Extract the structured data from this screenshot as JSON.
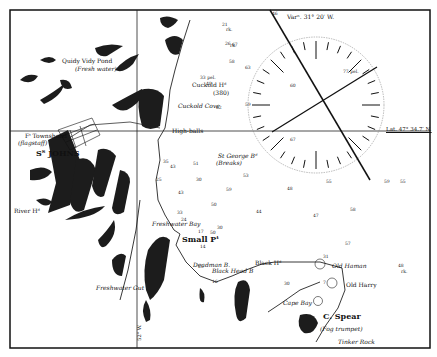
{
  "map": {
    "title": "Chart of St. John's Harbour and approaches",
    "variation_label": "Varⁿ. 31° 20′ W.",
    "latitude_label": "Lat. 47° 34.7′ N.",
    "meridian_label": "52° W.",
    "compass": {
      "center_x": 316,
      "center_y": 105,
      "radius": 68
    },
    "places": [
      {
        "name": "Quidy Vidy Pond",
        "x": 62,
        "y": 58,
        "size": "mid",
        "italic": false
      },
      {
        "name": "(Fresh water)",
        "x": 75,
        "y": 66,
        "size": "mid",
        "italic": true
      },
      {
        "name": "Cuckold Hᵈ",
        "x": 192,
        "y": 82,
        "size": "mid",
        "italic": false
      },
      {
        "name": "(380)",
        "x": 213,
        "y": 90,
        "size": "mid",
        "italic": false
      },
      {
        "name": "Cuckold Cove",
        "x": 178,
        "y": 103,
        "size": "mid",
        "italic": true
      },
      {
        "name": "High-balls",
        "x": 172,
        "y": 128,
        "size": "mid",
        "italic": false
      },
      {
        "name": "Fᵗ Townshend",
        "x": 25,
        "y": 133,
        "size": "mid",
        "italic": false
      },
      {
        "name": "(flagstaff)",
        "x": 18,
        "y": 140,
        "size": "mid",
        "italic": true
      },
      {
        "name": "Sᵀ JOHNS",
        "x": 36,
        "y": 149,
        "size": "big",
        "italic": false
      },
      {
        "name": "St George Bᵈ",
        "x": 218,
        "y": 153,
        "size": "mid",
        "italic": true
      },
      {
        "name": "(Breaks)",
        "x": 216,
        "y": 160,
        "size": "mid",
        "italic": true
      },
      {
        "name": "River Hᵈ",
        "x": 14,
        "y": 208,
        "size": "mid",
        "italic": false
      },
      {
        "name": "Freshwater Bay",
        "x": 152,
        "y": 221,
        "size": "mid",
        "italic": true
      },
      {
        "name": "Small Pᵗ",
        "x": 182,
        "y": 235,
        "size": "big",
        "italic": false
      },
      {
        "name": "Deadman B.",
        "x": 193,
        "y": 262,
        "size": "mid",
        "italic": true
      },
      {
        "name": "Black Head B",
        "x": 212,
        "y": 268,
        "size": "mid",
        "italic": true
      },
      {
        "name": "Black Hᵈ",
        "x": 255,
        "y": 260,
        "size": "mid",
        "italic": false
      },
      {
        "name": "Freshwater Gut",
        "x": 96,
        "y": 285,
        "size": "mid",
        "italic": true
      },
      {
        "name": "Old Haman",
        "x": 332,
        "y": 263,
        "size": "mid",
        "italic": true
      },
      {
        "name": "Old Harry",
        "x": 346,
        "y": 282,
        "size": "mid",
        "italic": false
      },
      {
        "name": "Cape Bay",
        "x": 283,
        "y": 300,
        "size": "mid",
        "italic": true
      },
      {
        "name": "C. Spear",
        "x": 323,
        "y": 312,
        "size": "big",
        "italic": false
      },
      {
        "name": "(Fog trumpet)",
        "x": 320,
        "y": 326,
        "size": "mid",
        "italic": true
      },
      {
        "name": "Tinker Rock",
        "x": 338,
        "y": 339,
        "size": "mid",
        "italic": true
      }
    ],
    "soundings": [
      {
        "v": "21",
        "x": 222,
        "y": 23
      },
      {
        "v": "rk.",
        "x": 226,
        "y": 28
      },
      {
        "v": "26",
        "x": 225,
        "y": 42
      },
      {
        "v": "rk.",
        "x": 230,
        "y": 44
      },
      {
        "v": "67",
        "x": 232,
        "y": 43
      },
      {
        "v": "63",
        "x": 245,
        "y": 66
      },
      {
        "v": "58",
        "x": 229,
        "y": 60
      },
      {
        "v": "62",
        "x": 216,
        "y": 106
      },
      {
        "v": "59",
        "x": 245,
        "y": 103
      },
      {
        "v": "49",
        "x": 206,
        "y": 82
      },
      {
        "v": "33 pel.",
        "x": 200,
        "y": 76
      },
      {
        "v": "60",
        "x": 290,
        "y": 84
      },
      {
        "v": "77 pel.",
        "x": 343,
        "y": 70
      },
      {
        "v": "67",
        "x": 290,
        "y": 138
      },
      {
        "v": "46",
        "x": 272,
        "y": 12
      },
      {
        "v": "48",
        "x": 287,
        "y": 187
      },
      {
        "v": "55",
        "x": 326,
        "y": 180
      },
      {
        "v": "59",
        "x": 226,
        "y": 188
      },
      {
        "v": "53",
        "x": 243,
        "y": 174
      },
      {
        "v": "59",
        "x": 384,
        "y": 180
      },
      {
        "v": "55",
        "x": 400,
        "y": 180
      },
      {
        "v": "50",
        "x": 211,
        "y": 203
      },
      {
        "v": "50",
        "x": 210,
        "y": 231
      },
      {
        "v": "44",
        "x": 256,
        "y": 210
      },
      {
        "v": "47",
        "x": 313,
        "y": 214
      },
      {
        "v": "58",
        "x": 350,
        "y": 208
      },
      {
        "v": "57",
        "x": 345,
        "y": 242
      },
      {
        "v": "48",
        "x": 398,
        "y": 264
      },
      {
        "v": "rk.",
        "x": 401,
        "y": 270
      },
      {
        "v": "31",
        "x": 323,
        "y": 255
      },
      {
        "v": "30",
        "x": 284,
        "y": 282
      },
      {
        "v": "7",
        "x": 323,
        "y": 281
      },
      {
        "v": "24",
        "x": 181,
        "y": 218
      },
      {
        "v": "17",
        "x": 198,
        "y": 230
      },
      {
        "v": "30",
        "x": 217,
        "y": 226
      },
      {
        "v": "14",
        "x": 200,
        "y": 245
      },
      {
        "v": "25",
        "x": 198,
        "y": 265
      },
      {
        "v": "16",
        "x": 212,
        "y": 280
      },
      {
        "v": "25",
        "x": 156,
        "y": 178
      },
      {
        "v": "35",
        "x": 163,
        "y": 160
      },
      {
        "v": "43",
        "x": 170,
        "y": 165
      },
      {
        "v": "51",
        "x": 193,
        "y": 162
      },
      {
        "v": "30",
        "x": 196,
        "y": 178
      },
      {
        "v": "43",
        "x": 178,
        "y": 191
      },
      {
        "v": "33",
        "x": 177,
        "y": 211
      }
    ]
  }
}
